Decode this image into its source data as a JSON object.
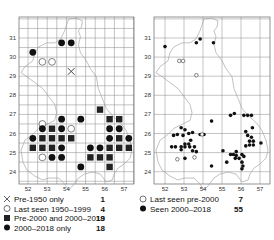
{
  "maps": [
    {
      "id": "left",
      "xticks": [
        "52",
        "53",
        "54",
        "55",
        "56",
        "57"
      ],
      "yticks": [
        "31",
        "30",
        "29",
        "28",
        "27",
        "26",
        "25",
        "24"
      ],
      "legend": [
        {
          "symbol": "cross",
          "label": "Pre-1950 only",
          "count": "1"
        },
        {
          "symbol": "open-circle",
          "label": "Last seen 1950–1999",
          "count": "4"
        },
        {
          "symbol": "square",
          "label": "Pre-2000 and 2000–2018",
          "count": "19"
        },
        {
          "symbol": "dot",
          "label": "2000–2018 only",
          "count": "18"
        }
      ],
      "records": [
        {
          "t": "dot",
          "x": 52.25,
          "y": 30.25
        },
        {
          "t": "dot",
          "x": 53.75,
          "y": 30.75
        },
        {
          "t": "dot",
          "x": 54.25,
          "y": 30.75
        },
        {
          "t": "open-circle",
          "x": 52.75,
          "y": 29.75
        },
        {
          "t": "open-circle",
          "x": 53.25,
          "y": 29.75
        },
        {
          "t": "cross",
          "x": 54.25,
          "y": 29.25
        },
        {
          "t": "square",
          "x": 55.75,
          "y": 27.25
        },
        {
          "t": "dot",
          "x": 53.75,
          "y": 26.75
        },
        {
          "t": "dot",
          "x": 54.75,
          "y": 26.75
        },
        {
          "t": "square",
          "x": 56.25,
          "y": 26.75
        },
        {
          "t": "square",
          "x": 56.75,
          "y": 26.75
        },
        {
          "t": "open-circle",
          "x": 52.75,
          "y": 26.5
        },
        {
          "t": "dot",
          "x": 52.75,
          "y": 26.25
        },
        {
          "t": "square",
          "x": 53.25,
          "y": 26.25
        },
        {
          "t": "dot",
          "x": 53.75,
          "y": 26.25
        },
        {
          "t": "open-circle",
          "x": 54.25,
          "y": 26.25
        },
        {
          "t": "dot",
          "x": 56.25,
          "y": 26.25
        },
        {
          "t": "dot",
          "x": 56.75,
          "y": 26.25
        },
        {
          "t": "dot",
          "x": 52.25,
          "y": 25.75
        },
        {
          "t": "square",
          "x": 52.75,
          "y": 25.75
        },
        {
          "t": "square",
          "x": 53.25,
          "y": 25.75
        },
        {
          "t": "square",
          "x": 53.75,
          "y": 25.75
        },
        {
          "t": "square",
          "x": 54.25,
          "y": 25.75
        },
        {
          "t": "dot",
          "x": 56.25,
          "y": 25.75
        },
        {
          "t": "square",
          "x": 56.75,
          "y": 25.75
        },
        {
          "t": "dot",
          "x": 57.25,
          "y": 25.75
        },
        {
          "t": "square",
          "x": 52.25,
          "y": 25.25
        },
        {
          "t": "square",
          "x": 52.75,
          "y": 25.25
        },
        {
          "t": "square",
          "x": 53.25,
          "y": 25.25
        },
        {
          "t": "dot",
          "x": 53.75,
          "y": 25.25
        },
        {
          "t": "dot",
          "x": 55.25,
          "y": 25.25
        },
        {
          "t": "dot",
          "x": 55.75,
          "y": 25.25
        },
        {
          "t": "square",
          "x": 56.25,
          "y": 25.25
        },
        {
          "t": "square",
          "x": 56.75,
          "y": 25.25
        },
        {
          "t": "square",
          "x": 57.25,
          "y": 25.25
        },
        {
          "t": "open-circle",
          "x": 52.75,
          "y": 24.75
        },
        {
          "t": "dot",
          "x": 53.25,
          "y": 24.75
        },
        {
          "t": "dot",
          "x": 53.75,
          "y": 24.75
        },
        {
          "t": "square",
          "x": 55.25,
          "y": 24.75
        },
        {
          "t": "square",
          "x": 55.75,
          "y": 24.75
        },
        {
          "t": "square",
          "x": 56.25,
          "y": 24.75
        },
        {
          "t": "dot",
          "x": 54.75,
          "y": 24.25
        },
        {
          "t": "square",
          "x": 56.25,
          "y": 24.25
        }
      ]
    },
    {
      "id": "right",
      "xticks": [
        "52",
        "53",
        "54",
        "55",
        "56",
        "57"
      ],
      "yticks": [
        "31",
        "30",
        "29",
        "28",
        "27",
        "26",
        "25",
        "24"
      ],
      "legend": [
        {
          "symbol": "open-circle",
          "label": "Last seen pre-2000",
          "count": "7"
        },
        {
          "symbol": "dot",
          "label": "Seen 2000–2018",
          "count": "55"
        }
      ],
      "records": [
        {
          "t": "dot",
          "x": 52.0,
          "y": 30.55
        },
        {
          "t": "dot",
          "x": 53.65,
          "y": 30.75
        },
        {
          "t": "dot",
          "x": 53.85,
          "y": 30.95
        },
        {
          "t": "dot",
          "x": 54.55,
          "y": 30.75
        },
        {
          "t": "open-circle",
          "x": 52.75,
          "y": 29.8
        },
        {
          "t": "open-circle",
          "x": 52.95,
          "y": 29.8
        },
        {
          "t": "open-circle",
          "x": 53.65,
          "y": 29.05
        },
        {
          "t": "dot",
          "x": 55.45,
          "y": 26.95
        },
        {
          "t": "dot",
          "x": 55.65,
          "y": 27.05
        },
        {
          "t": "dot",
          "x": 56.15,
          "y": 26.95
        },
        {
          "t": "dot",
          "x": 56.35,
          "y": 26.95
        },
        {
          "t": "dot",
          "x": 56.55,
          "y": 26.95
        },
        {
          "t": "dot",
          "x": 54.45,
          "y": 26.65
        },
        {
          "t": "dot",
          "x": 56.6,
          "y": 26.3
        },
        {
          "t": "dot",
          "x": 56.25,
          "y": 26.1
        },
        {
          "t": "dot",
          "x": 52.85,
          "y": 26.3
        },
        {
          "t": "dot",
          "x": 53.05,
          "y": 26.2
        },
        {
          "t": "dot",
          "x": 53.25,
          "y": 26.0
        },
        {
          "t": "dot",
          "x": 53.45,
          "y": 26.05
        },
        {
          "t": "dot",
          "x": 52.45,
          "y": 25.9
        },
        {
          "t": "dot",
          "x": 52.65,
          "y": 25.95
        },
        {
          "t": "dot",
          "x": 52.95,
          "y": 25.9
        },
        {
          "t": "dot",
          "x": 53.85,
          "y": 25.95
        },
        {
          "t": "dot",
          "x": 54.05,
          "y": 25.95
        },
        {
          "t": "open-circle",
          "x": 53.95,
          "y": 25.95
        },
        {
          "t": "dot",
          "x": 56.35,
          "y": 25.9
        },
        {
          "t": "dot",
          "x": 56.55,
          "y": 25.8
        },
        {
          "t": "dot",
          "x": 56.45,
          "y": 25.6
        },
        {
          "t": "dot",
          "x": 56.65,
          "y": 25.6
        },
        {
          "t": "dot",
          "x": 53.35,
          "y": 25.65
        },
        {
          "t": "dot",
          "x": 53.05,
          "y": 25.45
        },
        {
          "t": "dot",
          "x": 53.25,
          "y": 25.45
        },
        {
          "t": "dot",
          "x": 52.85,
          "y": 25.3
        },
        {
          "t": "dot",
          "x": 53.05,
          "y": 25.3
        },
        {
          "t": "dot",
          "x": 53.3,
          "y": 25.3
        },
        {
          "t": "dot",
          "x": 53.55,
          "y": 25.3
        },
        {
          "t": "dot",
          "x": 52.35,
          "y": 25.3
        },
        {
          "t": "dot",
          "x": 52.55,
          "y": 25.3
        },
        {
          "t": "dot",
          "x": 52.85,
          "y": 25.15
        },
        {
          "t": "dot",
          "x": 53.45,
          "y": 25.1
        },
        {
          "t": "dot",
          "x": 53.65,
          "y": 25.05
        },
        {
          "t": "dot",
          "x": 57.05,
          "y": 25.5
        },
        {
          "t": "dot",
          "x": 56.25,
          "y": 25.35
        },
        {
          "t": "dot",
          "x": 56.45,
          "y": 25.4
        },
        {
          "t": "dot",
          "x": 56.65,
          "y": 25.4
        },
        {
          "t": "dot",
          "x": 55.05,
          "y": 25.1
        },
        {
          "t": "dot",
          "x": 55.75,
          "y": 25.05
        },
        {
          "t": "dot",
          "x": 55.75,
          "y": 24.85
        },
        {
          "t": "dot",
          "x": 55.45,
          "y": 24.9
        },
        {
          "t": "dot",
          "x": 55.6,
          "y": 24.9
        },
        {
          "t": "dot",
          "x": 56.05,
          "y": 24.9
        },
        {
          "t": "dot",
          "x": 56.15,
          "y": 24.8
        },
        {
          "t": "dot",
          "x": 55.9,
          "y": 24.7
        },
        {
          "t": "dot",
          "x": 55.7,
          "y": 24.7
        },
        {
          "t": "dot",
          "x": 53.05,
          "y": 24.7
        },
        {
          "t": "open-circle",
          "x": 53.55,
          "y": 24.75
        },
        {
          "t": "dot",
          "x": 55.25,
          "y": 24.5
        },
        {
          "t": "dot",
          "x": 56.05,
          "y": 24.5
        },
        {
          "t": "dot",
          "x": 56.1,
          "y": 24.3
        },
        {
          "t": "dot",
          "x": 56.05,
          "y": 24.15
        },
        {
          "t": "dot",
          "x": 54.45,
          "y": 24.3
        },
        {
          "t": "open-circle",
          "x": 52.65,
          "y": 24.65
        }
      ]
    }
  ]
}
